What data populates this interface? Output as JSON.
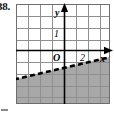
{
  "figure": {
    "problem_number": "38.",
    "labels": {
      "y_axis": "y",
      "x_axis": "x",
      "origin": "O",
      "y_unit": "1",
      "x_unit": "2"
    },
    "colors": {
      "grid_line": "#8f8f8f",
      "axis_line": "#000000",
      "shading": "#a8a8a8",
      "dashed_line": "#000000",
      "background": "#ffffff",
      "border": "#6e6e6e"
    },
    "grid": {
      "columns": 8,
      "rows": 8,
      "cell_size_px": 12,
      "left_px": 16,
      "top_px": 4,
      "width_px": 94,
      "height_px": 100
    },
    "axes": {
      "x_axis_y_px": 50,
      "y_axis_x_px": 64,
      "x_range": [
        -4,
        4
      ],
      "y_range": [
        -4.5,
        3.5
      ]
    },
    "boundary_line": {
      "style": "dashed",
      "description": "dashed line rising from lower-left to upper-right",
      "start_point_px": [
        16,
        79
      ],
      "end_point_px": [
        110,
        57
      ],
      "slope_estimate": 0.25,
      "y_intercept_estimate": -1.2
    },
    "shaded_region": {
      "description": "region below the dashed line is shaded gray",
      "position": "below-line"
    }
  }
}
